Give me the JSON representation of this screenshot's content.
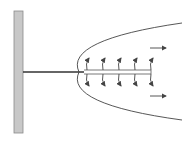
{
  "diagram": {
    "title": "",
    "wall": {
      "x": 14,
      "y": 11,
      "width": 9,
      "height": 122,
      "fill": "#c8c8c8",
      "stroke": "#8a8a8a"
    },
    "rod": {
      "x1": 23,
      "x2": 84,
      "y": 72,
      "color": "#333333"
    },
    "double_rod": {
      "x1": 84,
      "x2": 151,
      "y_top": 70,
      "y_bottom": 74,
      "color": "#555555"
    },
    "parabola": {
      "path": "M182,23 Q64,40 79,72 Q64,104 182,120",
      "color": "#444444"
    },
    "field_arrow_xs": [
      87,
      103,
      119,
      135,
      151
    ],
    "flow_arrows": [
      {
        "x1": 150,
        "x2": 166,
        "y": 48
      },
      {
        "x1": 150,
        "x2": 166,
        "y": 96
      }
    ],
    "arrow_color": "#444444"
  }
}
